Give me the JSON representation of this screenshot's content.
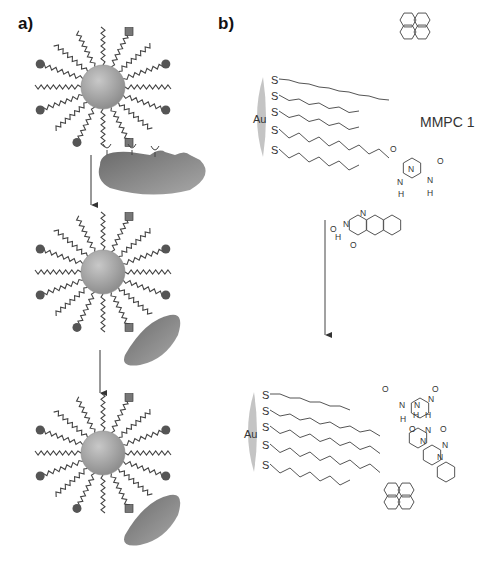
{
  "panel_a": {
    "label": "a)",
    "stages": [
      "nanoparticle with ligands",
      "nanoparticle approaching protein",
      "nanoparticle bound to protein"
    ]
  },
  "panel_b": {
    "label": "b)",
    "gold_label": "Au",
    "sulfur_label": "S",
    "compound_label": "MMPC 1",
    "atoms": {
      "O": "O",
      "N": "N",
      "H": "H"
    }
  },
  "colors": {
    "particle": "#a8a8a8",
    "ligand_head": "#555555",
    "protein": "#7a7a7a",
    "line": "#444444"
  }
}
